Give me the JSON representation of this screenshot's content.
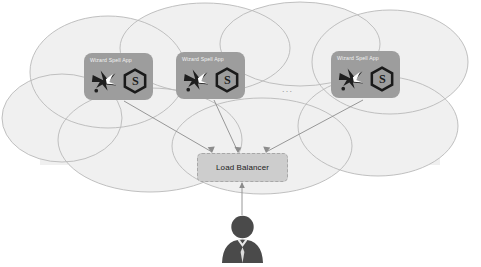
{
  "diagram": {
    "cloud": {
      "name": "cloud-boundary",
      "fill": "#f0f0f0",
      "stroke": "#b9b9b9"
    },
    "app_nodes": [
      {
        "id": "app-1",
        "label": "Wizard Spell App",
        "icons": [
          "wizard-icon",
          "hexagon-s-icon"
        ],
        "x": 84,
        "y": 53,
        "w": 69,
        "h": 47,
        "fill": "#9d9d9d"
      },
      {
        "id": "app-2",
        "label": "Wizard Spell App",
        "icons": [
          "wizard-icon",
          "hexagon-s-icon"
        ],
        "x": 176,
        "y": 52,
        "w": 69,
        "h": 47,
        "fill": "#9d9d9d"
      },
      {
        "id": "app-3",
        "label": "Wizard Spell App",
        "icons": [
          "wizard-icon",
          "hexagon-s-icon"
        ],
        "x": 331,
        "y": 51,
        "w": 69,
        "h": 47,
        "fill": "#9d9d9d"
      }
    ],
    "ellipsis": "...",
    "load_balancer": {
      "id": "load-balancer",
      "label": "Load Balancer",
      "fill": "#cdcdcd",
      "stroke": "#a8a8a8"
    },
    "user": {
      "id": "end-user",
      "icon": "user-person-icon",
      "fill": "#4a4a4a"
    },
    "connectors": [
      {
        "from": "load-balancer",
        "to": "app-1",
        "arrow": "to-load-balancer"
      },
      {
        "from": "load-balancer",
        "to": "app-2",
        "arrow": "to-load-balancer"
      },
      {
        "from": "load-balancer",
        "to": "app-3",
        "arrow": "to-load-balancer"
      },
      {
        "from": "end-user",
        "to": "load-balancer",
        "arrow": "to-load-balancer"
      }
    ],
    "colors": {
      "cloud_fill": "#f0f0f0",
      "cloud_stroke": "#b9b9b9",
      "app_fill": "#9d9d9d",
      "app_text": "#f2f2f2",
      "lb_fill": "#cdcdcd",
      "lb_text": "#1c1c1c",
      "user_fill": "#4a4a4a",
      "connector": "#8c8c8c"
    }
  }
}
